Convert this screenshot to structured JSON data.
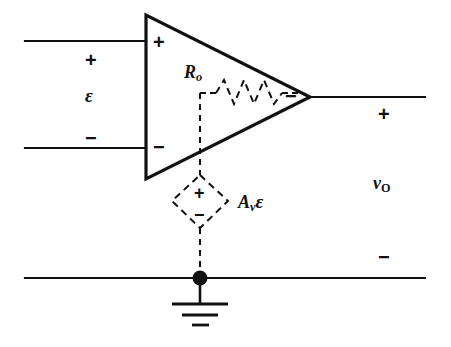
{
  "figure": {
    "type": "circuit-schematic",
    "background_color": "#ffffff",
    "line_color": "#111111"
  },
  "input_port": {
    "plus_sign": "+",
    "minus_sign": "−",
    "source_label_main": "ε",
    "description": "differential input voltage epsilon across input terminals"
  },
  "amplifier": {
    "symbol": "triangle",
    "input_plus_sign": "+",
    "input_minus_sign": "−",
    "output_minus_sign": "−"
  },
  "output_resistance": {
    "label_main": "R",
    "label_sub": "o",
    "style": "dashed-zigzag-resistor"
  },
  "dependent_source": {
    "shape": "diamond",
    "plus_sign": "+",
    "minus_sign": "−",
    "label_main": "A",
    "label_sub": "v",
    "label_tail": "ε",
    "style": "dashed"
  },
  "output_port": {
    "plus_sign": "+",
    "minus_sign": "−",
    "label_main": "v",
    "label_sub": "O",
    "description": "output voltage v sub O across output terminals"
  },
  "ground": {
    "symbol": "earth-ground",
    "bars": 3,
    "node_dot": true
  }
}
